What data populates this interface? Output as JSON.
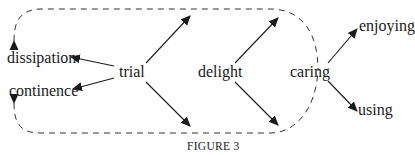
{
  "figure": {
    "caption": "FIGURE 3",
    "nodes": {
      "dissipation": "dissipation",
      "continence": "continence",
      "trial": "trial",
      "delight": "delight",
      "caring": "caring",
      "enjoying": "enjoying",
      "using": "using"
    },
    "edges": [
      {
        "from": "trial",
        "to": "dissipation"
      },
      {
        "from": "trial",
        "to": "continence"
      },
      {
        "from": "trial",
        "to": "delight-upper"
      },
      {
        "from": "trial",
        "to": "delight-lower"
      },
      {
        "from": "delight",
        "to": "caring-upper"
      },
      {
        "from": "delight",
        "to": "caring-lower"
      },
      {
        "from": "caring",
        "to": "enjoying"
      },
      {
        "from": "caring",
        "to": "using"
      },
      {
        "from": "dashed-loop",
        "to": "dissipation",
        "style": "dashed"
      },
      {
        "from": "dashed-loop",
        "to": "continence",
        "style": "dashed"
      }
    ],
    "colors": {
      "ink": "#1a1a1a",
      "background": "#ffffff"
    }
  }
}
